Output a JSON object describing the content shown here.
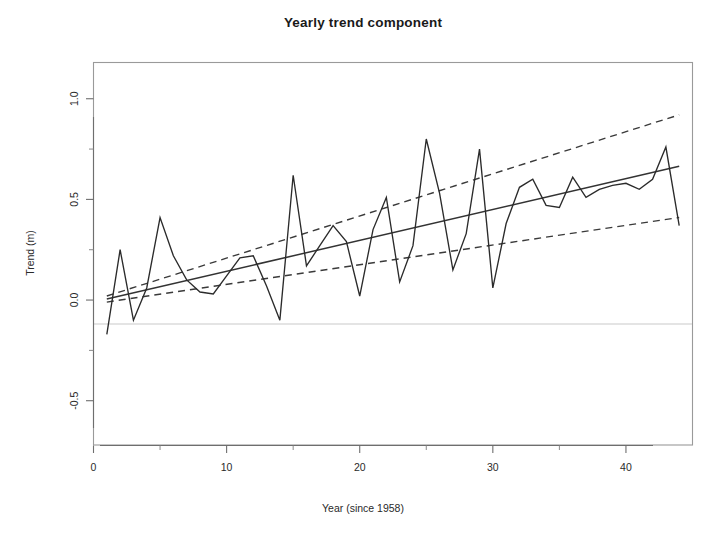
{
  "chart_data": {
    "type": "line",
    "title": "Yearly trend component",
    "xlabel": "Year (since 1958)",
    "ylabel": "Trend (m)",
    "xlim": [
      0.0,
      45.0
    ],
    "ylim": [
      -0.72,
      1.18
    ],
    "grid": false,
    "legend": null,
    "xticks": [
      0,
      10,
      20,
      30,
      40
    ],
    "xtick_labels": [
      "0",
      "10",
      "20",
      "30",
      "40"
    ],
    "yticks": [
      -0.5,
      0.0,
      0.5,
      1.0
    ],
    "ytick_labels": [
      "-0.5",
      "0.0",
      "0.5",
      "1.0"
    ],
    "x_minor_ticks": [
      5,
      15,
      25,
      35
    ],
    "y_minor_ticks": [
      -0.25,
      0.25,
      0.75
    ],
    "reference_line_y": 0.0,
    "series": [
      {
        "name": "Yearly trend component",
        "style": "solid",
        "color": "#2b2b2b",
        "x": [
          1,
          2,
          3,
          4,
          5,
          6,
          7,
          8,
          9,
          10,
          11,
          12,
          13,
          14,
          15,
          16,
          17,
          18,
          19,
          20,
          21,
          22,
          23,
          24,
          25,
          26,
          27,
          28,
          29,
          30,
          31,
          32,
          33,
          34,
          35,
          36,
          37,
          38,
          39,
          40,
          41,
          42,
          43,
          44
        ],
        "values": [
          -0.17,
          0.25,
          -0.1,
          0.06,
          0.41,
          0.22,
          0.1,
          0.04,
          0.03,
          0.12,
          0.21,
          0.22,
          0.07,
          -0.1,
          0.62,
          0.17,
          0.27,
          0.37,
          0.29,
          0.02,
          0.35,
          0.51,
          0.09,
          0.27,
          0.8,
          0.53,
          0.15,
          0.33,
          0.75,
          0.06,
          0.38,
          0.56,
          0.6,
          0.47,
          0.46,
          0.61,
          0.51,
          0.55,
          0.57,
          0.58,
          0.55,
          0.6,
          0.76,
          0.37
        ]
      },
      {
        "name": "fitted linear trend",
        "style": "solid",
        "color": "#333333",
        "x": [
          1,
          44
        ],
        "values": [
          0.005,
          0.665
        ]
      },
      {
        "name": "upper confidence band",
        "style": "dashed",
        "color": "#3a3a3a",
        "x": [
          1,
          44
        ],
        "values": [
          0.02,
          0.92
        ]
      },
      {
        "name": "lower confidence band",
        "style": "dashed",
        "color": "#3a3a3a",
        "x": [
          1,
          44
        ],
        "values": [
          -0.01,
          0.41
        ]
      }
    ]
  },
  "figure": {
    "background_color": "#ffffff",
    "foreground_color": "#1a1a1a",
    "frame_color": "#9a9a9a"
  }
}
